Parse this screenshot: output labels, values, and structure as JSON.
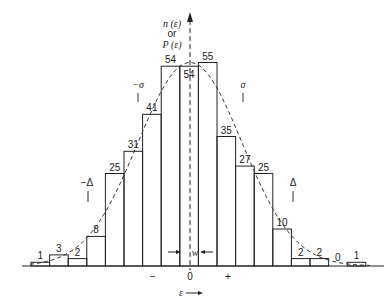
{
  "chart_data": {
    "type": "bar",
    "title": "",
    "xlabel": "ε →",
    "ylabel": "n (ε) or P (ε)",
    "categories": [
      "-9",
      "-8",
      "-7",
      "-6",
      "-5",
      "-4",
      "-3",
      "-2",
      "-1",
      "0",
      "+1",
      "+2",
      "+3",
      "+4",
      "+5",
      "+6",
      "+7",
      "+8"
    ],
    "values": [
      1,
      3,
      2,
      8,
      25,
      31,
      41,
      54,
      54,
      55,
      35,
      27,
      25,
      10,
      2,
      2,
      0,
      1
    ],
    "overlay": "gaussian (dashed)",
    "x_tick_labels": [
      "−",
      "0",
      "+"
    ],
    "annotations": {
      "minus_sigma": "−σ",
      "sigma": "σ",
      "minus_delta": "−Δ",
      "delta": "Δ",
      "bin_width": "w"
    },
    "grid": false,
    "legend": "none"
  },
  "axis": {
    "y_label_line1": "n (ε)",
    "y_label_line2": "or",
    "y_label_line3": "P (ε)",
    "x_label": "ε",
    "tick_minus": "−",
    "tick_zero": "0",
    "tick_plus": "+"
  },
  "annotations": {
    "minus_sigma": "−σ",
    "sigma": "σ",
    "minus_delta": "−Δ",
    "delta": "Δ",
    "w": "w"
  }
}
